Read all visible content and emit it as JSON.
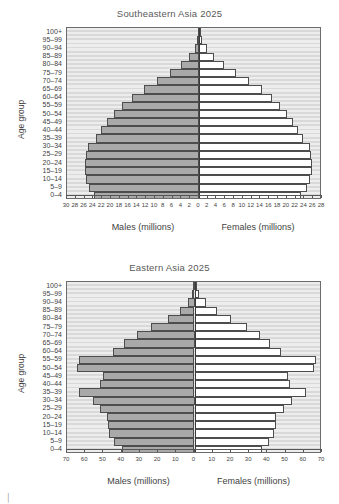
{
  "figure": {
    "age_group_axis_label": "Age group",
    "males_axis_label": "Males (millions)",
    "females_axis_label": "Females (millions)",
    "age_groups": [
      "100+",
      "95–99",
      "90–94",
      "85–89",
      "80–84",
      "75–79",
      "70–74",
      "65–69",
      "60–64",
      "55–59",
      "50–54",
      "45–49",
      "40–44",
      "35–39",
      "30–34",
      "25–29",
      "20–24",
      "15–19",
      "10–14",
      "5–9",
      "0–4"
    ],
    "colors": {
      "male_bar": "#a9a9a9",
      "female_bar": "#ffffff",
      "plot_background": "#d9d9d9",
      "stripe": "#ededed",
      "bar_outline": "#4d4d4d",
      "axis": "#3a3a3a",
      "text": "#3f3f3f"
    }
  },
  "chart_data": [
    {
      "type": "bar",
      "subtype": "population-pyramid",
      "title": "Southeastern Asia 2025",
      "xlabel": "",
      "ylabel": "Age group",
      "left_axis_label": "Males (millions)",
      "right_axis_label": "Females (millions)",
      "xlim": [
        -30,
        28
      ],
      "xticks": [
        30,
        28,
        26,
        24,
        22,
        20,
        18,
        16,
        14,
        12,
        10,
        8,
        6,
        4,
        2,
        0,
        2,
        4,
        6,
        8,
        10,
        12,
        14,
        16,
        18,
        20,
        22,
        24,
        26,
        28
      ],
      "xtick_step": 2,
      "xmax": 30,
      "grid": true,
      "legend": "none",
      "categories": [
        "100+",
        "95–99",
        "90–94",
        "85–89",
        "80–84",
        "75–79",
        "70–74",
        "65–69",
        "60–64",
        "55–59",
        "50–54",
        "45–49",
        "40–44",
        "35–39",
        "30–34",
        "25–29",
        "20–24",
        "15–19",
        "10–14",
        "5–9",
        "0–4"
      ],
      "series": [
        {
          "name": "Males (millions)",
          "side": "left",
          "values": [
            0.06,
            0.35,
            1.0,
            2.2,
            4.0,
            6.6,
            9.6,
            12.6,
            15.2,
            17.4,
            19.3,
            20.9,
            22.2,
            23.4,
            25.3,
            25.7,
            25.9,
            26.0,
            25.6,
            25.1,
            23.9
          ]
        },
        {
          "name": "Females (millions)",
          "side": "right",
          "values": [
            0.12,
            0.7,
            1.8,
            3.4,
            5.6,
            8.4,
            11.5,
            14.3,
            16.6,
            18.4,
            20.0,
            21.4,
            22.5,
            23.6,
            25.3,
            25.6,
            25.7,
            25.7,
            25.2,
            24.6,
            23.3
          ]
        }
      ]
    },
    {
      "type": "bar",
      "subtype": "population-pyramid",
      "title": "Eastern Asia 2025",
      "xlabel": "",
      "ylabel": "Age group",
      "left_axis_label": "Males (millions)",
      "right_axis_label": "Females (millions)",
      "xlim": [
        -70,
        70
      ],
      "xticks": [
        70,
        60,
        50,
        40,
        30,
        20,
        10,
        0,
        10,
        20,
        30,
        40,
        50,
        60,
        70
      ],
      "xtick_step": 10,
      "xmax": 70,
      "grid": true,
      "legend": "none",
      "categories": [
        "100+",
        "95–99",
        "90–94",
        "85–89",
        "80–84",
        "75–79",
        "70–74",
        "65–69",
        "60–64",
        "55–59",
        "50–54",
        "45–49",
        "40–44",
        "35–39",
        "30–34",
        "25–29",
        "20–24",
        "15–19",
        "10–14",
        "5–9",
        "0–4"
      ],
      "series": [
        {
          "name": "Males (millions)",
          "side": "left",
          "values": [
            0.2,
            1.2,
            3.5,
            8.0,
            14.5,
            24.0,
            31.5,
            38.5,
            45.0,
            63.5,
            64.5,
            50.0,
            52.0,
            63.5,
            56.0,
            52.0,
            48.0,
            47.5,
            47.0,
            44.0,
            40.0
          ]
        },
        {
          "name": "Females (millions)",
          "side": "right",
          "values": [
            0.6,
            2.5,
            6.5,
            12.5,
            20.0,
            29.0,
            36.0,
            41.5,
            47.5,
            66.5,
            65.5,
            51.5,
            52.5,
            61.0,
            53.5,
            49.0,
            45.0,
            44.5,
            43.5,
            41.0,
            37.0
          ]
        }
      ]
    }
  ]
}
